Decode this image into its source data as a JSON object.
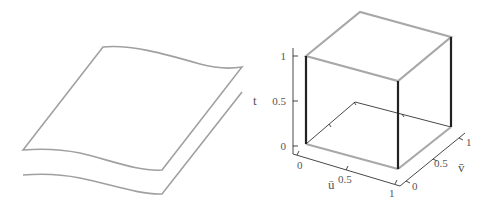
{
  "left_figure": {
    "description": "curved sheet surface with offset copy"
  },
  "right_figure": {
    "axes": {
      "t": {
        "label": "t",
        "ticks": [
          "0",
          "0.5",
          "1"
        ]
      },
      "u": {
        "label": "ū",
        "ticks": [
          "0",
          "0.5",
          "1"
        ]
      },
      "v": {
        "label": "v̄",
        "ticks": [
          "0",
          "0.5",
          "1"
        ]
      }
    },
    "colors": {
      "cube_top_edges": "#a8a8a8",
      "cube_vertical_edges": "#222222",
      "axis_lines": "#333333",
      "sheet_edges": "#a0a0a0"
    }
  }
}
